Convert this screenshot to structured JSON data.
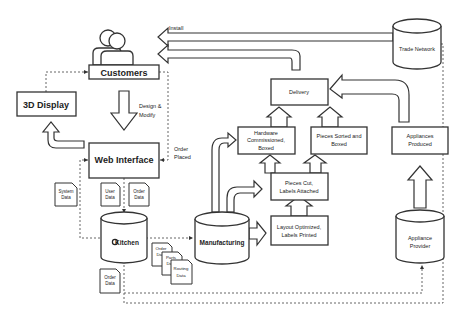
{
  "diagram": {
    "nodes": {
      "customers": {
        "label": "Customers"
      },
      "display_3d": {
        "label": "3D Display"
      },
      "web_interface": {
        "label": "Web Interface"
      },
      "kitchen": {
        "label": "Kitchen",
        "logo": "C"
      },
      "manufacturing": {
        "label": "Manufacturing"
      },
      "layout_optimized": {
        "line1": "Layout Optimized,",
        "line2": "Labels Printed"
      },
      "pieces_cut": {
        "line1": "Pieces Cut,",
        "line2": "Labels Attached"
      },
      "hardware_commissioned": {
        "line1": "Hardware",
        "line2": "Commissioned,",
        "line3": "Boxed"
      },
      "pieces_sorted": {
        "line1": "Pieces Sorted and",
        "line2": "Boxed"
      },
      "delivery": {
        "label": "Delivery"
      },
      "appliances_produced": {
        "line1": "Appliances",
        "line2": "Produced"
      },
      "appliance_provider": {
        "line1": "Appliance",
        "line2": "Provider"
      },
      "trade_network": {
        "label": "Trade Network"
      }
    },
    "edge_labels": {
      "install": "Install",
      "design_modify_1": "Design &",
      "design_modify_2": "Modify",
      "order_placed_1": "Order",
      "order_placed_2": "Placed"
    },
    "documents": {
      "system_data": {
        "line1": "System",
        "line2": "Data"
      },
      "user_data": {
        "line1": "User",
        "line2": "Data"
      },
      "order_data_top": {
        "line1": "Order",
        "line2": "Data"
      },
      "order_data_bottom": {
        "line1": "Order",
        "line2": "Data"
      },
      "order_data_stack": {
        "line1": "Order",
        "line2": "Data"
      },
      "parts_data": {
        "line1": "Parts",
        "line2": "Data"
      },
      "routing_data": {
        "line1": "Routing",
        "line2": "Data"
      }
    }
  }
}
